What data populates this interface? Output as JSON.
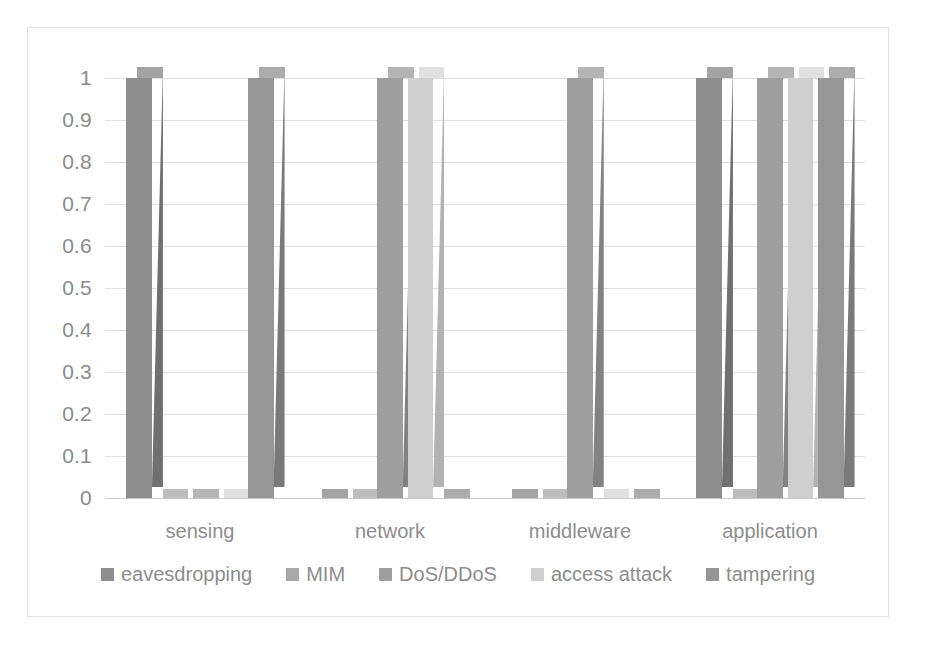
{
  "chart_data": {
    "type": "bar",
    "title": "",
    "subtitle": "",
    "xlabel": "",
    "ylabel": "",
    "ylim": [
      0,
      1
    ],
    "grid": true,
    "legend_position": "bottom",
    "style": "3d-clustered-column",
    "categories": [
      "sensing",
      "network",
      "middleware",
      "application"
    ],
    "ytick_labels": [
      "1",
      "0.9",
      "0.8",
      "0.7",
      "0.6",
      "0.5",
      "0.4",
      "0.3",
      "0.2",
      "0.1",
      "0"
    ],
    "ytick_values": [
      1,
      0.9,
      0.8,
      0.7,
      0.6,
      0.5,
      0.4,
      0.3,
      0.2,
      0.1,
      0
    ],
    "series": [
      {
        "name": "eavesdropping",
        "color": "#8d8d8d",
        "side_color": "#707070",
        "top_color": "#a3a3a3",
        "values": [
          1,
          0,
          0,
          1
        ]
      },
      {
        "name": "MIM",
        "color": "#a8a8a8",
        "side_color": "#8b8b8b",
        "top_color": "#bdbdbd",
        "values": [
          0,
          0,
          0,
          0
        ]
      },
      {
        "name": "DoS/DDoS",
        "color": "#9e9e9e",
        "side_color": "#828282",
        "top_color": "#b4b4b4",
        "values": [
          0,
          1,
          1,
          1
        ]
      },
      {
        "name": "access attack",
        "color": "#cfcfcf",
        "side_color": "#b2b2b2",
        "top_color": "#e0e0e0",
        "values": [
          0,
          1,
          0,
          1
        ]
      },
      {
        "name": "tampering",
        "color": "#969696",
        "side_color": "#7a7a7a",
        "top_color": "#acacac",
        "values": [
          1,
          0,
          0,
          1
        ]
      }
    ]
  },
  "legend": {
    "items": [
      {
        "label": "eavesdropping"
      },
      {
        "label": "MIM"
      },
      {
        "label": "DoS/DDoS"
      },
      {
        "label": "access attack"
      },
      {
        "label": "tampering"
      }
    ]
  },
  "colors": {
    "background": "#ffffff",
    "frame_border": "#e2e2e2",
    "gridline": "#e0e0e0",
    "axis": "#c9c9c9",
    "tick_text": "#8c8c8c",
    "label_text": "#8d8d8d"
  }
}
